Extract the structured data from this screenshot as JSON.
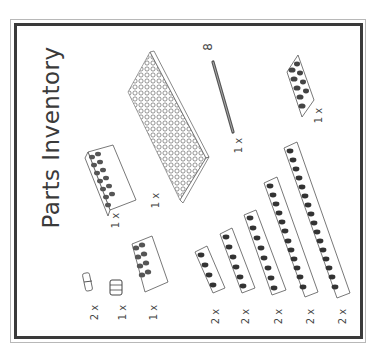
{
  "page": {
    "title": "Parts Inventory",
    "orientation": "rotated-90-ccw",
    "colors": {
      "frame": "#3a3a3a",
      "frame_outer": "#b8b8b8",
      "line_art": "#555555",
      "stud_dark": "#2e2e2e"
    }
  },
  "parts": [
    {
      "id": "brick-2x8",
      "name": "Brick 2x8",
      "quantity_label": "1 x"
    },
    {
      "id": "plate-8x16",
      "name": "Plate 8x16",
      "quantity_label": "1 x"
    },
    {
      "id": "axle-8",
      "name": "Technic axle",
      "length_label": "8",
      "quantity_label": "1 x"
    },
    {
      "id": "plate-1x6",
      "name": "Plate 1x6",
      "quantity_label": "1 x"
    },
    {
      "id": "pin",
      "name": "Technic pin",
      "quantity_label": "2 x"
    },
    {
      "id": "bushing",
      "name": "Technic bushing",
      "quantity_label": "1 x"
    },
    {
      "id": "brick-2x4",
      "name": "Brick 2x4",
      "quantity_label": "1 x"
    },
    {
      "id": "beam-1x4",
      "name": "Technic beam 1x4",
      "quantity_label": "2 x"
    },
    {
      "id": "beam-1x6",
      "name": "Technic beam 1x6",
      "quantity_label": "2 x"
    },
    {
      "id": "beam-1x8",
      "name": "Technic beam 1x8",
      "quantity_label": "2 x"
    },
    {
      "id": "beam-1x12",
      "name": "Technic beam 1x12",
      "quantity_label": "2 x"
    },
    {
      "id": "beam-1x16",
      "name": "Technic beam 1x16",
      "quantity_label": "2 x"
    }
  ]
}
